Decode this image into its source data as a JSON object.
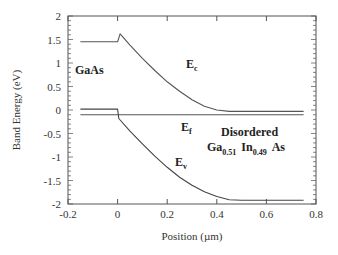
{
  "chart_data": {
    "type": "line",
    "title": "",
    "xlabel": "Position  (µm)",
    "ylabel": "Band Energy (eV)",
    "xlim": [
      -0.2,
      0.8
    ],
    "ylim": [
      -2,
      2
    ],
    "xticks": [
      -0.2,
      0,
      0.2,
      0.4,
      0.6,
      0.8
    ],
    "xtick_labels": [
      "-0.2",
      "0",
      "0.2",
      "0.4",
      "0.6",
      "0.8"
    ],
    "yticks": [
      -2,
      -1.5,
      -1,
      -0.5,
      0,
      0.5,
      1,
      1.5,
      2
    ],
    "ytick_labels": [
      "-2",
      "-1.5",
      "-1",
      "-0.5",
      "0",
      "0.5",
      "1",
      "1.5",
      "2"
    ],
    "grid": false,
    "legend": null,
    "series": [
      {
        "name": "Ec",
        "color": "#555555",
        "x": [
          -0.15,
          0.0,
          0.01,
          0.05,
          0.1,
          0.15,
          0.2,
          0.25,
          0.3,
          0.35,
          0.4,
          0.45,
          0.5,
          0.6,
          0.75
        ],
        "y": [
          1.45,
          1.45,
          1.62,
          1.38,
          1.1,
          0.84,
          0.6,
          0.4,
          0.22,
          0.08,
          -0.0,
          -0.03,
          -0.03,
          -0.03,
          -0.03
        ]
      },
      {
        "name": "Ef",
        "color": "#555555",
        "x": [
          -0.15,
          0.75
        ],
        "y": [
          -0.1,
          -0.1
        ]
      },
      {
        "name": "Ev",
        "color": "#444444",
        "x": [
          -0.15,
          0.0,
          0.005,
          0.05,
          0.1,
          0.15,
          0.2,
          0.25,
          0.3,
          0.35,
          0.4,
          0.45,
          0.5,
          0.6,
          0.75
        ],
        "y": [
          0.02,
          0.02,
          -0.18,
          -0.45,
          -0.72,
          -0.98,
          -1.22,
          -1.43,
          -1.6,
          -1.74,
          -1.84,
          -1.91,
          -1.92,
          -1.92,
          -1.92
        ]
      }
    ],
    "annotations": [
      {
        "text": "GaAs",
        "x": -0.16,
        "y": 1.05
      },
      {
        "text": "E",
        "sub": "c",
        "x": 0.28,
        "y": 1.25
      },
      {
        "text": "E",
        "sub": "f",
        "x": 0.24,
        "y": -0.38
      },
      {
        "text": "Disordered",
        "x": 0.45,
        "y": -0.5
      },
      {
        "text": "Ga0.51 In0.49 As",
        "x": 0.38,
        "y": -0.85
      },
      {
        "text": "E",
        "sub": "v",
        "x": 0.22,
        "y": -1.3
      }
    ]
  },
  "labels": {
    "gaas": "GaAs",
    "ec_main": "E",
    "ec_sub": "c",
    "ef_main": "E",
    "ef_sub": "f",
    "ev_main": "E",
    "ev_sub": "v",
    "disordered": "Disordered",
    "ga": "Ga",
    "ga_sub": "0.51",
    "in": "In",
    "in_sub": "0.49",
    "as": "As"
  }
}
